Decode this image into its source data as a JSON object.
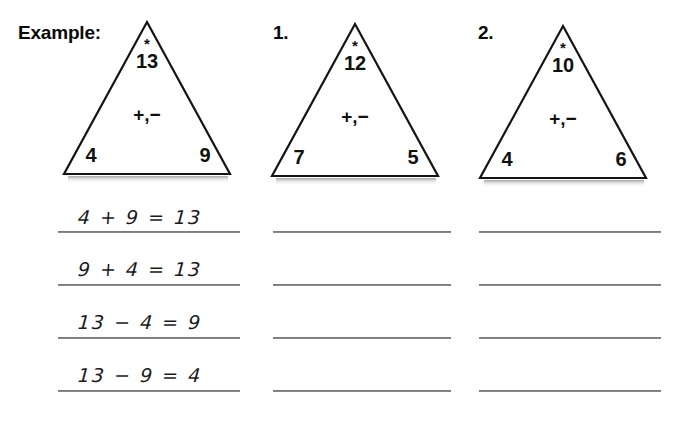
{
  "worksheet": {
    "background_color": "#ffffff",
    "ink_color": "#111111",
    "line_color": "#5c5c5c"
  },
  "columns": [
    {
      "label": "Example:",
      "triangle": {
        "star": "*",
        "top": "13",
        "operators": "+,−",
        "left": "4",
        "right": "9"
      },
      "answers": [
        "4 + 9 = 13",
        "9 + 4 = 13",
        "13 − 4 = 9",
        "13 − 9 = 4"
      ]
    },
    {
      "label": "1.",
      "triangle": {
        "star": "*",
        "top": "12",
        "operators": "+,−",
        "left": "7",
        "right": "5"
      },
      "answers": [
        "",
        "",
        "",
        ""
      ]
    },
    {
      "label": "2.",
      "triangle": {
        "star": "*",
        "top": "10",
        "operators": "+,−",
        "left": "4",
        "right": "6"
      },
      "answers": [
        "",
        "",
        "",
        ""
      ]
    }
  ]
}
